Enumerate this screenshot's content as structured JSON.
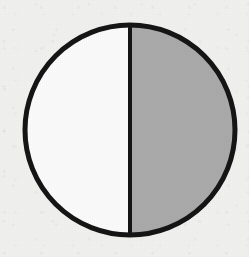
{
  "figure": {
    "name": "half-shaded-circle",
    "background_color": "#f1f1ef",
    "outline_color": "#151515",
    "divider_color": "#151515",
    "unshaded_color": "#fbfbfb",
    "shaded_color": "#aaaaaa",
    "geometry": {
      "center_x": 130,
      "center_y": 130,
      "radius": 105,
      "outline_width": 5,
      "divider_width": 4
    }
  },
  "chart_data": {
    "type": "pie",
    "title": "",
    "subtitle": "",
    "xlabel": "",
    "ylabel": "",
    "grid": false,
    "legend_position": "none",
    "categories": [
      "Unshaded half",
      "Shaded half"
    ],
    "values": [
      50,
      50
    ],
    "value_unit": "percent",
    "fractions": [
      "1/2",
      "1/2"
    ],
    "colors": [
      "#fbfbfb",
      "#aaaaaa"
    ],
    "slice_start_angle_deg": 0,
    "slice_angles_deg": [
      180,
      180
    ],
    "annotations": [],
    "tick_labels": []
  }
}
